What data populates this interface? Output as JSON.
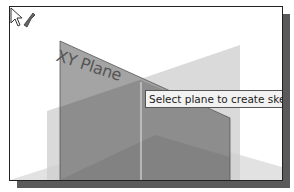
{
  "viewport": {
    "plane_label": "XY Plane",
    "tooltip": "Select plane to create sketch or",
    "cursor": "select-plane-cursor"
  },
  "colors": {
    "frame_border": "#222222",
    "shadow": "#5a5a5a",
    "plane_xy": "#8c8c8c",
    "plane_back": "#c8c8c8",
    "plane_front": "#a0a0a0",
    "tooltip_bg": "#f2f2f2"
  }
}
